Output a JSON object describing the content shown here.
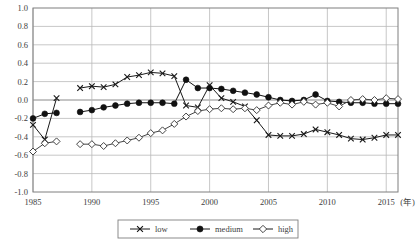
{
  "chart_data": {
    "type": "line",
    "title": "",
    "xlabel": "(年)",
    "ylabel": "",
    "xlim": [
      1985,
      2016
    ],
    "ylim": [
      -1.0,
      1.0
    ],
    "grid": true,
    "legend_position": "bottom",
    "x_ticks": [
      "1985",
      "1990",
      "1995",
      "2000",
      "2005",
      "2010",
      "2015"
    ],
    "x_tick_values": [
      1985,
      1990,
      1995,
      2000,
      2005,
      2010,
      2015
    ],
    "x_unit_label": "(年)",
    "y_ticks": [
      "1.0",
      "0.8",
      "0.6",
      "0.4",
      "0.2",
      "0.0",
      "-0.2",
      "-0.4",
      "-0.6",
      "-0.8",
      "-1.0"
    ],
    "y_tick_values": [
      1.0,
      0.8,
      0.6,
      0.4,
      0.2,
      0.0,
      -0.2,
      -0.4,
      -0.6,
      -0.8,
      -1.0
    ],
    "series": [
      {
        "name": "low",
        "marker": "x-cross",
        "color": "#1a1a1a",
        "x": [
          1985,
          1986,
          1987,
          1989,
          1990,
          1991,
          1992,
          1993,
          1994,
          1995,
          1996,
          1997,
          1998,
          1999,
          2000,
          2001,
          2002,
          2003,
          2004,
          2005,
          2006,
          2007,
          2008,
          2009,
          2010,
          2011,
          2012,
          2013,
          2014,
          2015,
          2016
        ],
        "values": [
          -0.27,
          -0.43,
          0.02,
          0.13,
          0.15,
          0.14,
          0.17,
          0.25,
          0.27,
          0.3,
          0.29,
          0.26,
          -0.06,
          -0.08,
          0.16,
          0.02,
          -0.02,
          -0.07,
          -0.22,
          -0.38,
          -0.39,
          -0.39,
          -0.37,
          -0.32,
          -0.35,
          -0.38,
          -0.42,
          -0.43,
          -0.41,
          -0.38,
          -0.38
        ]
      },
      {
        "name": "medium",
        "marker": "filled-circle",
        "color": "#111111",
        "x": [
          1985,
          1986,
          1987,
          1989,
          1990,
          1991,
          1992,
          1993,
          1994,
          1995,
          1996,
          1997,
          1998,
          1999,
          2000,
          2001,
          2002,
          2003,
          2004,
          2005,
          2006,
          2007,
          2008,
          2009,
          2010,
          2011,
          2012,
          2013,
          2014,
          2015,
          2016
        ],
        "values": [
          -0.2,
          -0.15,
          -0.14,
          -0.13,
          -0.11,
          -0.08,
          -0.06,
          -0.04,
          -0.03,
          -0.03,
          -0.03,
          -0.04,
          0.22,
          0.13,
          0.13,
          0.12,
          0.1,
          0.08,
          0.06,
          0.03,
          0.0,
          -0.01,
          0.0,
          0.06,
          -0.01,
          -0.02,
          -0.03,
          -0.03,
          -0.04,
          -0.04,
          -0.04
        ]
      },
      {
        "name": "high",
        "marker": "open-diamond",
        "color": "#444444",
        "x": [
          1985,
          1986,
          1987,
          1989,
          1990,
          1991,
          1992,
          1993,
          1994,
          1995,
          1996,
          1997,
          1998,
          1999,
          2000,
          2001,
          2002,
          2003,
          2004,
          2005,
          2006,
          2007,
          2008,
          2009,
          2010,
          2011,
          2012,
          2013,
          2014,
          2015,
          2016
        ],
        "values": [
          -0.56,
          -0.47,
          -0.45,
          -0.48,
          -0.48,
          -0.5,
          -0.47,
          -0.44,
          -0.41,
          -0.36,
          -0.33,
          -0.26,
          -0.18,
          -0.12,
          -0.1,
          -0.09,
          -0.1,
          -0.09,
          -0.11,
          -0.06,
          -0.03,
          -0.05,
          -0.02,
          -0.05,
          -0.03,
          -0.07,
          0.0,
          0.01,
          0.0,
          0.02,
          0.01
        ]
      }
    ],
    "legend": [
      {
        "label": "low",
        "marker": "x-cross"
      },
      {
        "label": "medium",
        "marker": "filled-circle"
      },
      {
        "label": "high",
        "marker": "open-diamond"
      }
    ],
    "colors": {
      "grid": "#b9b9b9",
      "frame": "#7f7f7f",
      "zero_line": "#8a8a8a",
      "text": "#3d3d3d",
      "background": "#ffffff"
    }
  }
}
